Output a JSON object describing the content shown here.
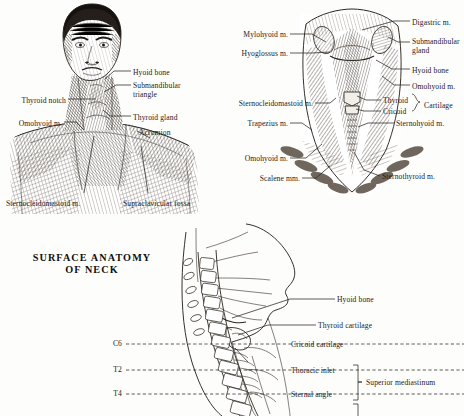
{
  "page": {
    "background_color": "#fdfdfb",
    "ink_color": "#2a2622",
    "width": 464,
    "height": 416
  },
  "figures": [
    {
      "id": "surface-anatomy-anterior-neck",
      "kind": "engraving",
      "description": "Anterior view of head, neck and shoulders showing surface landmarks",
      "labels": [
        {
          "name": "hyoid-bone",
          "text": "Hyoid bone",
          "x": 133,
          "y": 68,
          "align": "left"
        },
        {
          "name": "submandibular-triangle",
          "text": "Submandibular\ntriangle",
          "x": 133,
          "y": 81,
          "align": "left"
        },
        {
          "name": "thyroid-gland",
          "text": "Thyroid gland",
          "x": 133,
          "y": 113,
          "align": "left"
        },
        {
          "name": "acromion",
          "text": "Acromion",
          "x": 139,
          "y": 128,
          "align": "left"
        },
        {
          "name": "thyroid-notch",
          "text": "Thyroid notch",
          "x": 66,
          "y": 96,
          "align": "right"
        },
        {
          "name": "omohyoid-m",
          "text": "Omohyoid m.",
          "x": 62,
          "y": 119,
          "align": "right"
        },
        {
          "name": "sternocleidomastoid-m",
          "text": "Sternocleidomastoid m.",
          "x": 6,
          "y": 199,
          "align": "left"
        },
        {
          "name": "supraclavicular-fossa",
          "text": "Supraclavicular fossa",
          "x": 123,
          "y": 199,
          "align": "left"
        }
      ]
    },
    {
      "id": "deep-dissection-anterior-neck",
      "kind": "engraving",
      "description": "Deep dissection of anterior neck muscles viewed from the front",
      "labels": [
        {
          "name": "digastric-m",
          "text": "Digastric m.",
          "x": 412,
          "y": 18,
          "align": "left"
        },
        {
          "name": "submandibular-gland",
          "text": "Submandibular\ngland",
          "x": 412,
          "y": 39,
          "align": "left"
        },
        {
          "name": "hyoid-bone",
          "text": "Hyoid bone",
          "x": 412,
          "y": 66,
          "align": "left"
        },
        {
          "name": "omohyoid-m-right",
          "text": "Omohyoid m.",
          "x": 412,
          "y": 82,
          "align": "left"
        },
        {
          "name": "thyroid",
          "text": "Thyroid",
          "x": 383,
          "y": 97,
          "align": "left"
        },
        {
          "name": "cricoid",
          "text": "Cricoid",
          "x": 383,
          "y": 108,
          "align": "left"
        },
        {
          "name": "cartilage",
          "text": "Cartilage",
          "x": 424,
          "y": 102,
          "align": "left"
        },
        {
          "name": "sternohyoid-m",
          "text": "Sternohyoid m.",
          "x": 396,
          "y": 120,
          "align": "left"
        },
        {
          "name": "sternothyroid-m",
          "text": "Sternothyroid m.",
          "x": 382,
          "y": 173,
          "align": "left"
        },
        {
          "name": "mylohyoid-m",
          "text": "Mylohyoid m.",
          "x": 288,
          "y": 31,
          "align": "right"
        },
        {
          "name": "hyoglossus-m",
          "text": "Hyoglossus m.",
          "x": 288,
          "y": 50,
          "align": "right"
        },
        {
          "name": "sternocleidomastoid-m",
          "text": "Sternocleidomastoid m.",
          "x": 313,
          "y": 100,
          "align": "right"
        },
        {
          "name": "trapezius-m",
          "text": "Trapezius m.",
          "x": 288,
          "y": 120,
          "align": "right"
        },
        {
          "name": "omohyoid-m-left",
          "text": "Omohyoid m.",
          "x": 288,
          "y": 155,
          "align": "right"
        },
        {
          "name": "scalene-mm",
          "text": "Scalene mm.",
          "x": 300,
          "y": 175,
          "align": "right"
        }
      ]
    },
    {
      "id": "sagittal-section-neck",
      "kind": "line-drawing",
      "description": "Mid-sagittal outline of head and neck with vertebral levels",
      "title": "SURFACE ANATOMY\nOF NECK",
      "title_x": 92,
      "title_y": 252,
      "labels": [
        {
          "name": "vertebra-c6",
          "text": "C6",
          "x": 122,
          "y": 340,
          "align": "right"
        },
        {
          "name": "vertebra-t2",
          "text": "T2",
          "x": 122,
          "y": 366,
          "align": "right"
        },
        {
          "name": "vertebra-t4",
          "text": "T4",
          "x": 122,
          "y": 390,
          "align": "right"
        },
        {
          "name": "hyoid-bone",
          "text": "Hyoid bone",
          "x": 337,
          "y": 296,
          "align": "left"
        },
        {
          "name": "thyroid-cartilage",
          "text": "Thyroid cartilage",
          "x": 318,
          "y": 322,
          "align": "left"
        },
        {
          "name": "cricoid-cartilage",
          "text": "Cricoid cartilage",
          "x": 291,
          "y": 342,
          "align": "left"
        },
        {
          "name": "thoracic-inlet",
          "text": "Thoracic inlet",
          "x": 291,
          "y": 369,
          "align": "left"
        },
        {
          "name": "sternal-angle",
          "text": "Sternal angle",
          "x": 291,
          "y": 394,
          "align": "left"
        },
        {
          "name": "superior-mediastinum",
          "text": "Superior mediastinum",
          "x": 362,
          "y": 381,
          "align": "left"
        }
      ]
    }
  ]
}
